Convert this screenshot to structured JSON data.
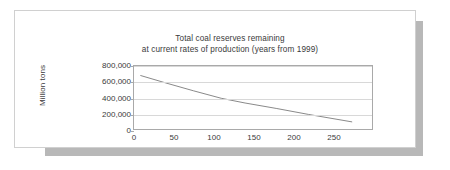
{
  "chart_data": {
    "type": "line",
    "title": "Total coal reserves remaining",
    "subtitle": "at current rates of production (years from 1999)",
    "xlabel": "",
    "ylabel": "Million tons",
    "xlim": [
      0,
      300
    ],
    "ylim": [
      0,
      800000
    ],
    "grid": true,
    "legend": "none",
    "xticks": [
      "0",
      "50",
      "100",
      "150",
      "200",
      "250"
    ],
    "xtick_values": [
      0,
      50,
      100,
      150,
      200,
      250
    ],
    "yticks": [
      "0",
      "200,000",
      "400,000",
      "600,000",
      "800,000"
    ],
    "ytick_values": [
      0,
      200000,
      400000,
      600000,
      800000
    ],
    "series": [
      {
        "name": "Total coal reserves remaining",
        "color": "#6b6b6b",
        "x": [
          8,
          40,
          75,
          110,
          140,
          180,
          220,
          275
        ],
        "values": [
          680000,
          585000,
          485000,
          390000,
          330000,
          260000,
          185000,
          90000
        ]
      }
    ]
  },
  "chart": {
    "title_line1": "Total coal reserves remaining",
    "title_line2": "at current rates of production (years from 1999)",
    "y_axis_title": "Million tons"
  }
}
